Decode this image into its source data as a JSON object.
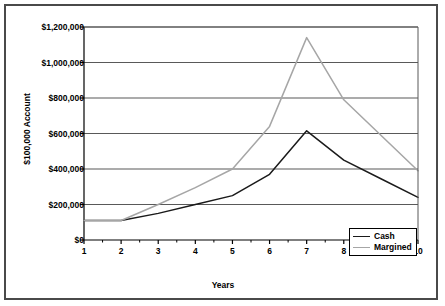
{
  "chart_data": {
    "type": "line",
    "title": "",
    "xlabel": "Years",
    "ylabel": "$100,000 Account",
    "x": [
      1,
      2,
      3,
      4,
      5,
      6,
      7,
      8,
      9,
      10
    ],
    "categories": [
      "1",
      "2",
      "3",
      "4",
      "5",
      "6",
      "7",
      "8",
      "9",
      "10"
    ],
    "xtick_labels": [
      "1",
      "2",
      "3",
      "4",
      "5",
      "6",
      "7",
      "8",
      "9",
      "10"
    ],
    "ytick_labels": [
      "$0",
      "$200,000",
      "$400,000",
      "$600,000",
      "$800,000",
      "$1,000,000",
      "$1,200,000"
    ],
    "ytick_values": [
      0,
      200000,
      400000,
      600000,
      800000,
      1000000,
      1200000
    ],
    "ylim": [
      0,
      1200000
    ],
    "xlim": [
      1,
      10
    ],
    "grid": "horizontal",
    "legend_position": "bottom-right",
    "background_color": "#ffffff",
    "frame_color": "#4a4a4a",
    "axis_color": "#000000",
    "gridline_color": "#595959",
    "series": [
      {
        "name": "Cash",
        "color": "#1a1a1a",
        "values": [
          110000,
          110000,
          150000,
          200000,
          250000,
          370000,
          615000,
          450000,
          345000,
          240000
        ]
      },
      {
        "name": "Margined",
        "color": "#a6a6a6",
        "values": [
          110000,
          110000,
          200000,
          295000,
          400000,
          640000,
          1140000,
          790000,
          590000,
          390000
        ]
      }
    ]
  },
  "legend": {
    "items": [
      {
        "label": "Cash"
      },
      {
        "label": "Margined"
      }
    ]
  },
  "axes": {
    "y_title": "$100,000 Account",
    "x_title": "Years"
  }
}
